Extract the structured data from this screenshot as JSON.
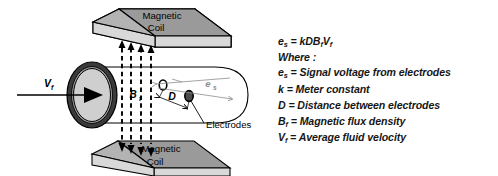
{
  "figure": {
    "title_alt": "Magnetic flowmeter principle diagram",
    "background_color": "#ffffff",
    "ink_color": "#000000",
    "coil_top_face_color": "#9a9a9a",
    "coil_side_face_color": "#d8d8d8",
    "pipe_fill_color": "#ffffff",
    "inlet_disc_color": "#c9c9c9",
    "inlet_ring_color": "#3a3a3a",
    "annotation_gray": "#8d8d8d",
    "electrode_dark_color": "#4a4a4a",
    "electrode_light_color": "#ffffff"
  },
  "diagram_labels": {
    "coil_top_line1": "Magnetic",
    "coil_top_line2": "Coil",
    "coil_bottom_line1": "Magnetic",
    "coil_bottom_line2": "Coil",
    "velocity_symbol": "V",
    "velocity_subscript": "f",
    "flux_symbol": "B",
    "flux_subscript": "f",
    "distance_symbol": "D",
    "signal_symbol": "e",
    "signal_subscript": "s",
    "electrodes_callout": "Electrodes"
  },
  "equation": {
    "lhs_symbol": "e",
    "lhs_subscript": "s",
    "equals": " = ",
    "rhs": "kDB",
    "rhs_sub1": "f",
    "rhs_tail": "V",
    "rhs_sub2": "f",
    "full_text": "es = kDBfVf"
  },
  "legend": {
    "where_label": "Where :",
    "items": [
      {
        "symbol": "e",
        "subscript": "s",
        "definition": "= Signal voltage from electrodes"
      },
      {
        "symbol": "k",
        "subscript": "",
        "definition": "= Meter constant"
      },
      {
        "symbol": "D",
        "subscript": "",
        "definition": "= Distance between electrodes"
      },
      {
        "symbol": "B",
        "subscript": "f",
        "definition": "= Magnetic flux density"
      },
      {
        "symbol": "V",
        "subscript": "f",
        "definition": "= Average fluid velocity"
      }
    ]
  }
}
